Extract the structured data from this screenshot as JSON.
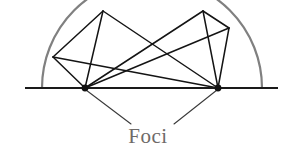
{
  "figure": {
    "canvas": {
      "width": 294,
      "height": 160,
      "background": "#ffffff"
    },
    "label": {
      "text": "Foci",
      "x": 148,
      "y": 143,
      "color": "#6e6a68",
      "font_size": 21
    }
  },
  "colors": {
    "arc": "#808080",
    "baseline": "#1a1a1a",
    "chord": "#141414",
    "leader": "#3a3a3a",
    "focus": "#111111",
    "label": "#6e6a68",
    "background": "#ffffff"
  },
  "chart_data": {
    "type": "scatter",
    "title": "Foci",
    "xlabel": "",
    "ylabel": "",
    "xlim": [
      0,
      294
    ],
    "ylim": [
      160,
      0
    ],
    "grid": false,
    "legend": null,
    "arc": {
      "name": "semicircular-arc",
      "center_x": 152,
      "center_y": 88,
      "radius": 110,
      "start_x": 42,
      "start_y": 88,
      "end_x": 262,
      "end_y": 88,
      "color": "#808080",
      "stroke_width": 2.2
    },
    "baseline": {
      "name": "horizontal-baseline",
      "x1": 25,
      "y1": 88,
      "x2": 278,
      "y2": 88,
      "color": "#1a1a1a",
      "stroke_width": 1.8
    },
    "foci": [
      {
        "name": "left-focus",
        "label": "F1",
        "x": 85,
        "y": 88,
        "radius": 3.4
      },
      {
        "name": "right-focus",
        "label": "F2",
        "x": 218,
        "y": 88,
        "radius": 3.4
      }
    ],
    "arc_points": [
      {
        "name": "arc-point-left",
        "x": 53,
        "y": 57
      },
      {
        "name": "arc-point-top-left",
        "x": 103,
        "y": 11
      },
      {
        "name": "arc-point-top-right",
        "x": 203,
        "y": 11
      },
      {
        "name": "arc-point-right",
        "x": 229,
        "y": 28
      }
    ],
    "chords": [
      {
        "name": "chord-left-focus-to-arc-left",
        "x1": 85,
        "y1": 88,
        "x2": 53,
        "y2": 57
      },
      {
        "name": "chord-left-focus-to-arc-top-left",
        "x1": 85,
        "y1": 88,
        "x2": 103,
        "y2": 11
      },
      {
        "name": "chord-left-focus-to-arc-top-right",
        "x1": 85,
        "y1": 88,
        "x2": 203,
        "y2": 11
      },
      {
        "name": "chord-left-focus-to-arc-right",
        "x1": 85,
        "y1": 88,
        "x2": 229,
        "y2": 28
      },
      {
        "name": "chord-right-focus-to-arc-left",
        "x1": 218,
        "y1": 88,
        "x2": 53,
        "y2": 57
      },
      {
        "name": "chord-right-focus-to-arc-top-left",
        "x1": 218,
        "y1": 88,
        "x2": 103,
        "y2": 11
      },
      {
        "name": "chord-right-focus-to-arc-top-right",
        "x1": 218,
        "y1": 88,
        "x2": 203,
        "y2": 11
      },
      {
        "name": "chord-right-focus-to-arc-right",
        "x1": 218,
        "y1": 88,
        "x2": 229,
        "y2": 28
      },
      {
        "name": "chord-arc-left-to-arc-top-left",
        "x1": 53,
        "y1": 57,
        "x2": 103,
        "y2": 11
      },
      {
        "name": "chord-arc-top-right-to-arc-right",
        "x1": 203,
        "y1": 11,
        "x2": 229,
        "y2": 28
      }
    ],
    "leaders": [
      {
        "name": "leader-to-left-focus",
        "x1": 131,
        "y1": 124,
        "x2": 86,
        "y2": 90
      },
      {
        "name": "leader-to-right-focus",
        "x1": 174,
        "y1": 124,
        "x2": 217,
        "y2": 90
      }
    ],
    "annotations": [
      {
        "name": "foci-label",
        "text": "Foci",
        "x": 148,
        "y": 143
      }
    ]
  }
}
